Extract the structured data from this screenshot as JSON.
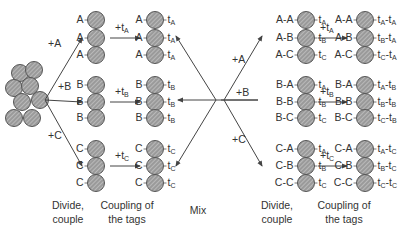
{
  "colors": {
    "bead_fill": "#9a9a9a",
    "bead_stroke": "#555555",
    "hatch": "#e0e0e0",
    "line": "#444444",
    "text": "#333333"
  },
  "pool": {
    "label": "resin-bead-pool"
  },
  "step1": {
    "arrows": [
      {
        "label": "+A",
        "x": 48,
        "y": 44
      },
      {
        "label": "+B",
        "x": 58,
        "y": 87
      },
      {
        "label": "+C",
        "x": 48,
        "y": 136
      }
    ]
  },
  "column1": {
    "groups": [
      {
        "rows": [
          "A",
          "A",
          "A"
        ]
      },
      {
        "rows": [
          "B",
          "B",
          "B"
        ]
      },
      {
        "rows": [
          "C",
          "C",
          "C"
        ]
      }
    ]
  },
  "step2": {
    "arrows": [
      {
        "main": "+t",
        "sub": "A"
      },
      {
        "main": "+t",
        "sub": "B"
      },
      {
        "main": "+t",
        "sub": "C"
      }
    ]
  },
  "column2": {
    "groups": [
      {
        "rows": [
          {
            "l": "A",
            "t": "A"
          },
          {
            "l": "A",
            "t": "A"
          },
          {
            "l": "A",
            "t": "A"
          }
        ]
      },
      {
        "rows": [
          {
            "l": "B",
            "t": "B"
          },
          {
            "l": "B",
            "t": "B"
          },
          {
            "l": "B",
            "t": "B"
          }
        ]
      },
      {
        "rows": [
          {
            "l": "C",
            "t": "C"
          },
          {
            "l": "C",
            "t": "C"
          },
          {
            "l": "C",
            "t": "C"
          }
        ]
      }
    ]
  },
  "step3": {
    "arrows": [
      {
        "label": "+A"
      },
      {
        "label": "+B"
      },
      {
        "label": "+C"
      }
    ]
  },
  "column3": {
    "groups": [
      {
        "rows": [
          {
            "l": "A-A",
            "t": "A"
          },
          {
            "l": "A-B",
            "t": "B"
          },
          {
            "l": "A-C",
            "t": "C"
          }
        ]
      },
      {
        "rows": [
          {
            "l": "B-A",
            "t": "A"
          },
          {
            "l": "B-B",
            "t": "B"
          },
          {
            "l": "B-C",
            "t": "C"
          }
        ]
      },
      {
        "rows": [
          {
            "l": "C-A",
            "t": "A"
          },
          {
            "l": "C-B",
            "t": "B"
          },
          {
            "l": "C-C",
            "t": "C"
          }
        ]
      }
    ]
  },
  "step4": {
    "arrows": [
      {
        "main": "+t",
        "sub": "A"
      },
      {
        "main": "+t",
        "sub": "B"
      },
      {
        "main": "+t",
        "sub": "C"
      }
    ]
  },
  "column4": {
    "groups": [
      {
        "rows": [
          {
            "l": "A-A",
            "t1": "A",
            "t2": "A"
          },
          {
            "l": "A-B",
            "t1": "B",
            "t2": "A"
          },
          {
            "l": "A-C",
            "t1": "C",
            "t2": "A"
          }
        ]
      },
      {
        "rows": [
          {
            "l": "B-A",
            "t1": "A",
            "t2": "B"
          },
          {
            "l": "B-B",
            "t1": "B",
            "t2": "B"
          },
          {
            "l": "B-C",
            "t1": "C",
            "t2": "B"
          }
        ]
      },
      {
        "rows": [
          {
            "l": "C-A",
            "t1": "A",
            "t2": "C"
          },
          {
            "l": "C-B",
            "t1": "B",
            "t2": "C"
          },
          {
            "l": "C-C",
            "t1": "C",
            "t2": "C"
          }
        ]
      }
    ]
  },
  "captions": {
    "divide1": [
      "Divide,",
      "couple"
    ],
    "coupling1": [
      "Coupling of",
      "the tags"
    ],
    "mix": "Mix",
    "divide2": [
      "Divide,",
      "couple"
    ],
    "coupling2": [
      "Coupling of",
      "the tags"
    ]
  }
}
